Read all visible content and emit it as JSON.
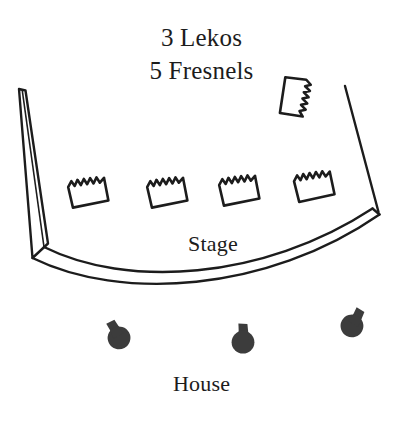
{
  "diagram": {
    "kind": "theatrical-lighting-plot",
    "title": {
      "line_1": "3 Lekos",
      "line_2": "5 Fresnels"
    },
    "labels": {
      "stage": "Stage",
      "house": "House"
    },
    "colors": {
      "background": "#ffffff",
      "ink": "#1c1c1c",
      "fixture_outline": "#1c1c1c",
      "leko_fill": "#3c3c3c"
    },
    "counts": {
      "lekos": 3,
      "fresnels": 5
    },
    "architecture": {
      "left_wall": {
        "name": "left-stage-wall",
        "shape": "tapered-quadrilateral",
        "points": "19,89 25,90 48,243 33,258"
      },
      "right_wall": {
        "name": "right-stage-wall",
        "shape": "line",
        "points": "345,86 377,211"
      },
      "stage_front": {
        "name": "stage-front-edge",
        "shape": "double-arc-band",
        "outer": "M 33,258 C 120,300 265,292 379,215",
        "inner": "M 44,247 C 125,288 262,281 372,209"
      }
    },
    "fresnels": [
      {
        "name": "fresnel-1",
        "x": 88,
        "y": 194,
        "rotation": -6
      },
      {
        "name": "fresnel-2",
        "x": 167,
        "y": 194,
        "rotation": -6
      },
      {
        "name": "fresnel-3",
        "x": 239,
        "y": 192,
        "rotation": -6
      },
      {
        "name": "fresnel-4",
        "x": 314,
        "y": 188,
        "rotation": -7
      },
      {
        "name": "fresnel-5",
        "x": 293,
        "y": 96,
        "rotation": 104
      }
    ],
    "lekos": [
      {
        "name": "leko-1",
        "x": 118,
        "y": 336,
        "rotation": -28
      },
      {
        "name": "leko-2",
        "x": 243,
        "y": 340,
        "rotation": 0
      },
      {
        "name": "leko-3",
        "x": 353,
        "y": 324,
        "rotation": 28
      }
    ]
  }
}
